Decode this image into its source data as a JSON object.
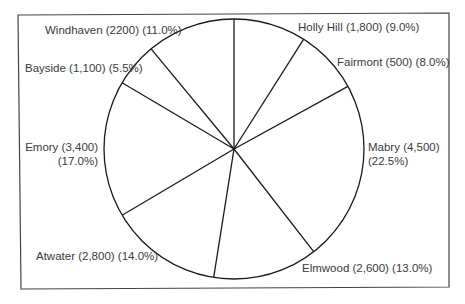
{
  "chart_data": {
    "type": "pie",
    "title": "",
    "start_angle_deg": 0,
    "direction": "clockwise",
    "total": 20000,
    "slices": [
      {
        "name": "Holly Hill",
        "value": 1800,
        "value_label": "1,800",
        "percent": 9.0,
        "percent_label": "9.0%"
      },
      {
        "name": "Fairmont",
        "value": 500,
        "value_label": "500",
        "percent": 8.0,
        "percent_label": "8.0%"
      },
      {
        "name": "Mabry",
        "value": 4500,
        "value_label": "4,500",
        "percent": 22.5,
        "percent_label": "22.5%"
      },
      {
        "name": "Elmwood",
        "value": 2600,
        "value_label": "2,600",
        "percent": 13.0,
        "percent_label": "13.0%"
      },
      {
        "name": "Atwater",
        "value": 2800,
        "value_label": "2,800",
        "percent": 14.0,
        "percent_label": "14.0%"
      },
      {
        "name": "Emory",
        "value": 3400,
        "value_label": "3,400",
        "percent": 17.0,
        "percent_label": "17.0%"
      },
      {
        "name": "Bayside",
        "value": 1100,
        "value_label": "1,100",
        "percent": 5.5,
        "percent_label": "5.5%"
      },
      {
        "name": "Windhaven",
        "value": 2200,
        "value_label": "2200",
        "percent": 11.0,
        "percent_label": "11.0%"
      }
    ],
    "legend": "none (labels placed beside slices)",
    "fill": "none (white slices, black outlines)"
  },
  "labels": {
    "holly_hill": "Holly Hill (1,800) (9.0%)",
    "fairmont": "Fairmont (500) (8.0%)",
    "mabry_line1": "Mabry (4,500)",
    "mabry_line2": "(22.5%)",
    "elmwood": "Elmwood (2,600) (13.0%)",
    "atwater": "Atwater (2,800) (14.0%)",
    "emory_line1": "Emory (3,400)",
    "emory_line2": "(17.0%)",
    "bayside": "Bayside (1,100) (5.5%)",
    "windhaven": "Windhaven (2200) (11.0%)"
  },
  "layout": {
    "center_x": 234,
    "center_y": 149,
    "radius": 130
  }
}
